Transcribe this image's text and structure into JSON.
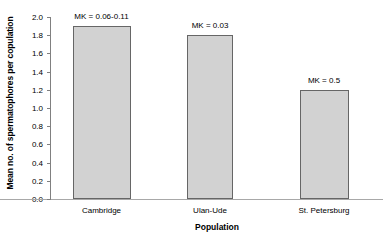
{
  "chart_data": {
    "type": "bar",
    "title": "",
    "subtitle": "",
    "xlabel": "Population",
    "ylabel": "Mean no. of spermatophores per copulation",
    "categories": [
      "Cambridge",
      "Ulan-Ude",
      "St. Petersburg"
    ],
    "values": [
      1.9,
      1.8,
      1.2
    ],
    "annotations": [
      "MK = 0.06-0.11",
      "MK = 0.03",
      "MK = 0.5"
    ],
    "ylim": [
      0.0,
      2.0
    ],
    "ytick_step": 0.2,
    "ytick_labels": [
      "0.0",
      "0.2",
      "0.4",
      "0.6",
      "0.8",
      "1.0",
      "1.2",
      "1.4",
      "1.6",
      "1.8",
      "2.0"
    ],
    "ytick_values": [
      0.0,
      0.2,
      0.4,
      0.6,
      0.8,
      1.0,
      1.2,
      1.4,
      1.6,
      1.8,
      2.0
    ],
    "grid": false,
    "legend": null,
    "legend_position": "none",
    "bar_fill_color": "#d2d2d2",
    "bar_border_color": "#666666",
    "axis_color": "#808080",
    "text_color": "#000000",
    "background_color": "#ffffff"
  }
}
